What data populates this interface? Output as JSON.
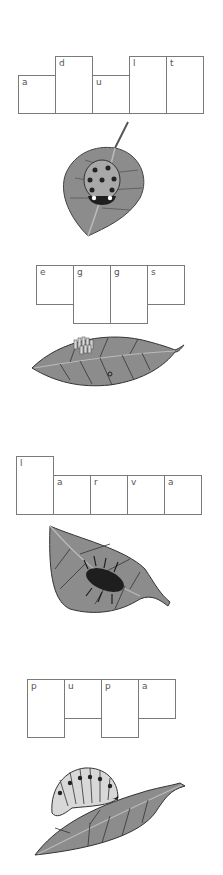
{
  "worksheet": {
    "words": [
      {
        "word": "adult",
        "letters": [
          {
            "char": "a",
            "x": 18,
            "y": 75,
            "w": 38,
            "h": 39
          },
          {
            "char": "d",
            "x": 55,
            "y": 56,
            "w": 38,
            "h": 58
          },
          {
            "char": "u",
            "x": 92,
            "y": 75,
            "w": 38,
            "h": 39
          },
          {
            "char": "l",
            "x": 129,
            "y": 56,
            "w": 38,
            "h": 58
          },
          {
            "char": "t",
            "x": 166,
            "y": 56,
            "w": 38,
            "h": 58
          }
        ],
        "illustration": "ladybug-on-leaf-icon"
      },
      {
        "word": "eggs",
        "letters": [
          {
            "char": "e",
            "x": 36,
            "y": 265,
            "w": 38,
            "h": 40
          },
          {
            "char": "g",
            "x": 73,
            "y": 265,
            "w": 38,
            "h": 59
          },
          {
            "char": "g",
            "x": 110,
            "y": 265,
            "w": 38,
            "h": 59
          },
          {
            "char": "s",
            "x": 147,
            "y": 265,
            "w": 38,
            "h": 40
          }
        ],
        "illustration": "eggs-on-leaf-icon"
      },
      {
        "word": "larva",
        "letters": [
          {
            "char": "l",
            "x": 16,
            "y": 456,
            "w": 38,
            "h": 59
          },
          {
            "char": "a",
            "x": 53,
            "y": 475,
            "w": 38,
            "h": 40
          },
          {
            "char": "r",
            "x": 90,
            "y": 475,
            "w": 38,
            "h": 40
          },
          {
            "char": "v",
            "x": 127,
            "y": 475,
            "w": 38,
            "h": 40
          },
          {
            "char": "a",
            "x": 164,
            "y": 475,
            "w": 38,
            "h": 40
          }
        ],
        "illustration": "larva-on-leaf-icon"
      },
      {
        "word": "pupa",
        "letters": [
          {
            "char": "p",
            "x": 27,
            "y": 679,
            "w": 38,
            "h": 59
          },
          {
            "char": "u",
            "x": 64,
            "y": 679,
            "w": 38,
            "h": 40
          },
          {
            "char": "p",
            "x": 101,
            "y": 679,
            "w": 38,
            "h": 59
          },
          {
            "char": "a",
            "x": 138,
            "y": 679,
            "w": 38,
            "h": 40
          }
        ],
        "illustration": "pupa-on-leaf-icon"
      }
    ],
    "colors": {
      "box_border": "#7a7a7a",
      "letter": "#555555",
      "leaf_fill": "#8c8c8c",
      "leaf_vein": "#3a3a3a",
      "insect": "#1e1e1e"
    }
  }
}
